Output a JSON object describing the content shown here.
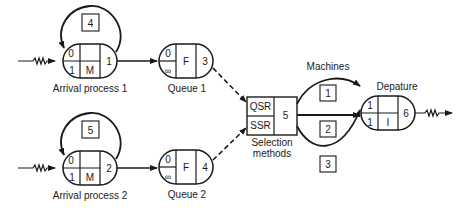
{
  "diagram": {
    "arrival1": {
      "label": "Arrival process 1",
      "top_left": "0",
      "bottom_left": "1",
      "bottom_mid": "M",
      "top_mid": "",
      "id": "1",
      "loop_box": "4"
    },
    "arrival2": {
      "label": "Arrival process 2",
      "top_left": "0",
      "bottom_left": "1",
      "bottom_mid": "M",
      "top_mid": "",
      "id": "2",
      "loop_box": "5"
    },
    "queue1": {
      "label": "Queue 1",
      "top_left": "0",
      "bottom_left": "∞",
      "mid": "F",
      "id": "3"
    },
    "queue2": {
      "label": "Queue 2",
      "top_left": "0",
      "bottom_left": "∞",
      "mid": "F",
      "id": "4"
    },
    "selection": {
      "label_line1": "Selection",
      "label_line2": "methods",
      "top": "QSR",
      "bottom": "SSR",
      "id": "5"
    },
    "machines": {
      "label": "Machines",
      "boxes": [
        "1",
        "2",
        "3"
      ]
    },
    "departure": {
      "label": "Depature",
      "top_left": "1",
      "bottom_left": "1",
      "bottom_mid": "I",
      "top_mid": "",
      "id": "6"
    },
    "colors": {
      "stroke": "#1a1a1a",
      "background": "#ffffff"
    }
  }
}
